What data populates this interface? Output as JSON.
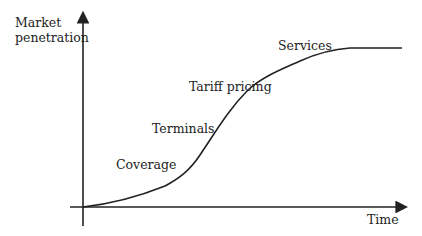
{
  "diagram": {
    "type": "s-curve",
    "y_axis_label_line1": "Market",
    "y_axis_label_line2": "penetration",
    "x_axis_label": "Time",
    "stages": [
      {
        "label": "Coverage"
      },
      {
        "label": "Terminals"
      },
      {
        "label": "Tariff pricing"
      },
      {
        "label": "Services"
      }
    ],
    "line_color": "#222222"
  }
}
